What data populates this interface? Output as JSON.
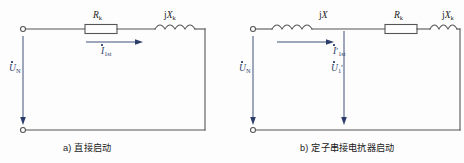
{
  "figure": {
    "background_color": "#fdfdfd",
    "wire_color": "#555555",
    "phasor_color": "#2b3c6b",
    "label_color": "#1c1c1c"
  },
  "circuits": [
    {
      "id": "circuit-a",
      "caption": "a) 直接启动",
      "source_label": {
        "symbol": "U",
        "subscript": "N",
        "prime": "",
        "dot": true
      },
      "current_label": {
        "symbol": "I",
        "subscript": "1st",
        "prime": "",
        "dot": true
      },
      "components": [
        {
          "type": "resistor",
          "label_symbol": "R",
          "label_subscript": "k",
          "label_prefix": ""
        },
        {
          "type": "inductor",
          "label_symbol": "X",
          "label_subscript": "k",
          "label_prefix": "j"
        }
      ],
      "terminals": [
        "top-left-terminal",
        "bottom-left-terminal"
      ]
    },
    {
      "id": "circuit-b",
      "caption": "b) 定子串接电抗器启动",
      "source_label": {
        "symbol": "U",
        "subscript": "N",
        "prime": "",
        "dot": true
      },
      "current_label": {
        "symbol": "I",
        "subscript": "1st",
        "prime": "′",
        "dot": true
      },
      "secondary_voltage_label": {
        "symbol": "U",
        "subscript": "1",
        "prime": "′",
        "dot": true
      },
      "components": [
        {
          "type": "inductor",
          "label_symbol": "X",
          "label_subscript": "",
          "label_prefix": "j"
        },
        {
          "type": "resistor",
          "label_symbol": "R",
          "label_subscript": "k",
          "label_prefix": ""
        },
        {
          "type": "inductor",
          "label_symbol": "X",
          "label_subscript": "k",
          "label_prefix": "j"
        }
      ],
      "terminals": [
        "top-left-terminal",
        "bottom-left-terminal"
      ]
    }
  ],
  "labels": {
    "a_resistor": "R",
    "a_resistor_sub": "k",
    "a_inductor_prefix": "j",
    "a_inductor": "X",
    "a_inductor_sub": "k",
    "a_current": "I",
    "a_current_sub": "1st",
    "a_voltage": "U",
    "a_voltage_sub": "N",
    "b_inductor1_prefix": "j",
    "b_inductor1": "X",
    "b_resistor": "R",
    "b_resistor_sub": "k",
    "b_inductor2_prefix": "j",
    "b_inductor2": "X",
    "b_inductor2_sub": "k",
    "b_current": "I",
    "b_current_sub": "1st",
    "b_current_prime": "′",
    "b_voltage_src": "U",
    "b_voltage_src_sub": "N",
    "b_voltage_out": "U",
    "b_voltage_out_sub": "1",
    "b_voltage_out_prime": "′"
  },
  "captions": {
    "a": "a) 直接启动",
    "b": "b) 定子串接电抗器启动"
  }
}
